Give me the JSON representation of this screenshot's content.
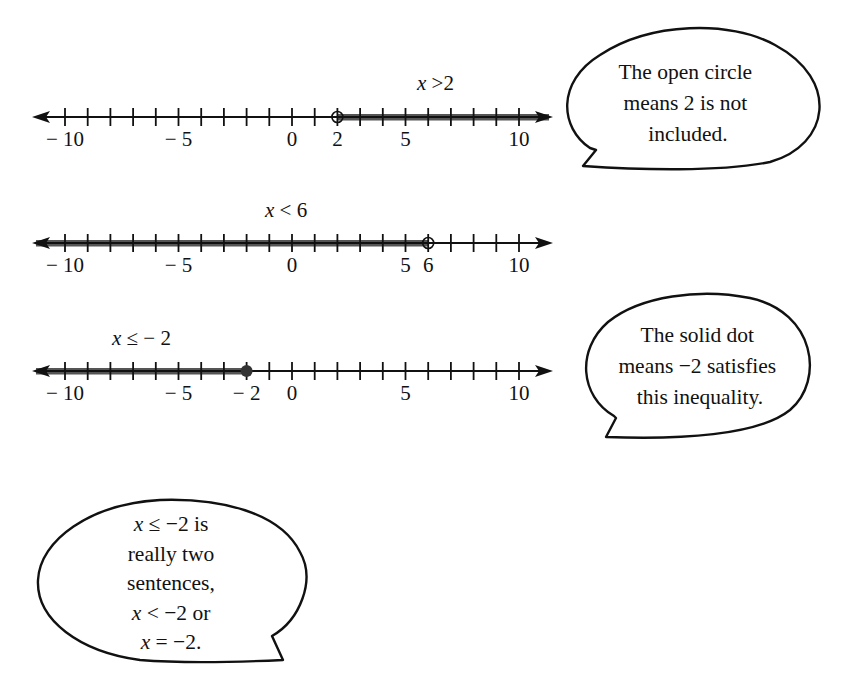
{
  "number_lines": [
    {
      "id": "line-x-gt-2",
      "label_var": "x",
      "label_rest": " >2",
      "y": 117,
      "label_x": 417,
      "label_y": 90,
      "tick_labels": [
        {
          "value": -10,
          "text": "− 10"
        },
        {
          "value": -5,
          "text": "− 5"
        },
        {
          "value": 0,
          "text": "0"
        },
        {
          "value": 2,
          "text": "2"
        },
        {
          "value": 5,
          "text": "5"
        },
        {
          "value": 10,
          "text": "10"
        }
      ],
      "endpoint": 2,
      "endpoint_style": "open",
      "shade_direction": "right"
    },
    {
      "id": "line-x-lt-6",
      "label_var": "x",
      "label_rest": " < 6",
      "y": 243,
      "label_x": 265,
      "label_y": 217,
      "tick_labels": [
        {
          "value": -10,
          "text": "− 10"
        },
        {
          "value": -5,
          "text": "− 5"
        },
        {
          "value": 0,
          "text": "0"
        },
        {
          "value": 5,
          "text": "5"
        },
        {
          "value": 6,
          "text": "6"
        },
        {
          "value": 10,
          "text": "10"
        }
      ],
      "endpoint": 6,
      "endpoint_style": "open",
      "shade_direction": "left"
    },
    {
      "id": "line-x-le-neg2",
      "label_var": "x",
      "label_rest": " ≤  − 2",
      "y": 371,
      "label_x": 112,
      "label_y": 345,
      "tick_labels": [
        {
          "value": -10,
          "text": "− 10"
        },
        {
          "value": -5,
          "text": "− 5"
        },
        {
          "value": -2,
          "text": "− 2"
        },
        {
          "value": 0,
          "text": "0"
        },
        {
          "value": 5,
          "text": "5"
        },
        {
          "value": 10,
          "text": "10"
        }
      ],
      "endpoint": -2,
      "endpoint_style": "solid",
      "shade_direction": "left"
    }
  ],
  "axis": {
    "min_tick": -10,
    "max_tick": 10,
    "origin_x": 292,
    "unit_px": 22.7,
    "arrow_left_x": 32,
    "arrow_right_x": 553,
    "line_color": "#111111",
    "shade_color": "#555555"
  },
  "callouts": [
    {
      "id": "open-circle-note",
      "lines": [
        "The open circle",
        "means 2 is not",
        "included."
      ]
    },
    {
      "id": "solid-dot-note",
      "lines": [
        "The solid dot",
        "means  −2 satisfies",
        "this inequality."
      ]
    },
    {
      "id": "two-sentences-note",
      "lines": [
        {
          "var": "x",
          "rest": " ≤ −2 is"
        },
        {
          "var": "",
          "rest": "really two"
        },
        {
          "var": "",
          "rest": "sentences,"
        },
        {
          "var": "x",
          "rest": " < −2 or"
        },
        {
          "var": "x",
          "rest": " = −2."
        }
      ]
    }
  ]
}
